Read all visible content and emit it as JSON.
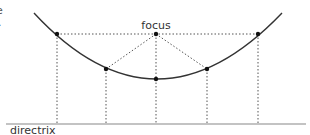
{
  "diagram": {
    "labels": {
      "focus": "focus",
      "directrix": "directrix",
      "clipped_left_1": "e",
      "clipped_left_2": "."
    },
    "colors": {
      "curve": "#333333",
      "dotted": "#555555",
      "directrix": "#888888",
      "points": "#111111"
    },
    "focus": {
      "x": 156,
      "y": 34
    },
    "points": [
      {
        "x": 57,
        "y": 34
      },
      {
        "x": 106,
        "y": 69
      },
      {
        "x": 156,
        "y": 79
      },
      {
        "x": 207,
        "y": 69
      },
      {
        "x": 258,
        "y": 34
      }
    ],
    "directrix_y": 124
  }
}
